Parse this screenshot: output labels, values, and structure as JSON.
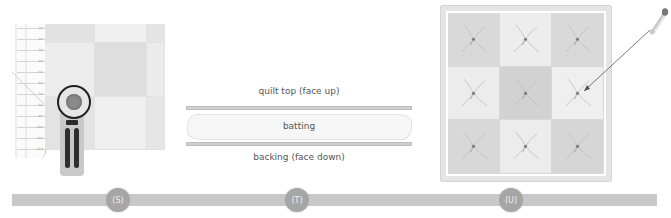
{
  "left_panel": {
    "ruler_labels": [
      "1in",
      "2in",
      "3in",
      "4in",
      "5in",
      "6in",
      "7in",
      "8in",
      "9in",
      "10in",
      "11in",
      "12in"
    ],
    "grid_cell_shades": [
      "#e2e2e2",
      "#f0f0f0",
      "#e4e4e4",
      "#ececec",
      "#dedede",
      "#ebebeb",
      "#e3e3e3",
      "#efefef",
      "#e6e6e6"
    ],
    "tool_icon": "rotary-cutter-icon"
  },
  "middle_panel": {
    "quilt_top_label": "quilt top (face up)",
    "batting_label": "batting",
    "backing_label": "backing (face down)"
  },
  "right_panel": {
    "tile_shades": [
      "#d9d9d9",
      "#ededed",
      "#d9d9d9",
      "#ececec",
      "#d2d2d2",
      "#efefef",
      "#d8d8d8",
      "#ececec",
      "#d6d6d6"
    ],
    "pin_icon": "safety-pin-icon"
  },
  "timeline": {
    "steps": [
      {
        "label": "(S)"
      },
      {
        "label": "(T)"
      },
      {
        "label": "(U)"
      }
    ]
  }
}
